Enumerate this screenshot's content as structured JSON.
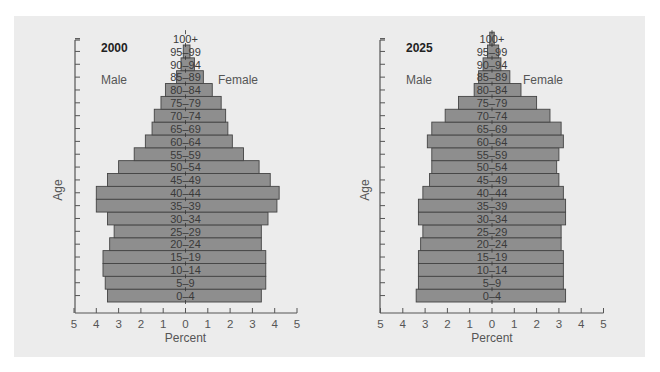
{
  "chart_data": [
    {
      "type": "bar",
      "subtype": "population-pyramid",
      "title": "2000",
      "xlabel": "Percent",
      "ylabel": "Age",
      "left_label": "Male",
      "right_label": "Female",
      "xlim": [
        -5,
        5
      ],
      "x_ticks": [
        "5",
        "4",
        "3",
        "2",
        "1",
        "0",
        "1",
        "2",
        "3",
        "4",
        "5"
      ],
      "grid": false,
      "categories": [
        "0–4",
        "5–9",
        "10–14",
        "15–19",
        "20–24",
        "25–29",
        "30–34",
        "35–39",
        "40–44",
        "45–49",
        "50–54",
        "55–59",
        "60–64",
        "65–69",
        "70–74",
        "75–79",
        "80–84",
        "85–89",
        "90–94",
        "95–99",
        "100+"
      ],
      "series": [
        {
          "name": "Male",
          "values": [
            3.5,
            3.6,
            3.7,
            3.7,
            3.4,
            3.2,
            3.5,
            4.0,
            4.0,
            3.5,
            3.0,
            2.3,
            1.8,
            1.5,
            1.4,
            1.1,
            0.9,
            0.4,
            0.2,
            0.1,
            0.0
          ]
        },
        {
          "name": "Female",
          "values": [
            3.4,
            3.6,
            3.6,
            3.6,
            3.4,
            3.4,
            3.7,
            4.1,
            4.2,
            3.8,
            3.3,
            2.6,
            2.1,
            1.9,
            1.8,
            1.6,
            1.2,
            0.8,
            0.4,
            0.2,
            0.0
          ]
        }
      ]
    },
    {
      "type": "bar",
      "subtype": "population-pyramid",
      "title": "2025",
      "xlabel": "Percent",
      "ylabel": "Age",
      "left_label": "Male",
      "right_label": "Female",
      "xlim": [
        -5,
        5
      ],
      "x_ticks": [
        "5",
        "4",
        "3",
        "2",
        "1",
        "0",
        "1",
        "2",
        "3",
        "4",
        "5"
      ],
      "grid": false,
      "categories": [
        "0–4",
        "5–9",
        "10–14",
        "15–19",
        "20–24",
        "25–29",
        "30–34",
        "35–39",
        "40–44",
        "45–49",
        "50–54",
        "55–59",
        "60–64",
        "65–69",
        "70–74",
        "75–79",
        "80–84",
        "85–89",
        "90–94",
        "95–99",
        "100+"
      ],
      "series": [
        {
          "name": "Male",
          "values": [
            3.4,
            3.3,
            3.3,
            3.3,
            3.2,
            3.1,
            3.3,
            3.3,
            3.1,
            2.8,
            2.7,
            2.7,
            2.9,
            2.7,
            2.1,
            1.5,
            0.8,
            0.6,
            0.4,
            0.2,
            0.1
          ]
        },
        {
          "name": "Female",
          "values": [
            3.3,
            3.2,
            3.2,
            3.2,
            3.1,
            3.1,
            3.3,
            3.3,
            3.2,
            3.0,
            2.9,
            3.0,
            3.2,
            3.1,
            2.6,
            2.0,
            1.3,
            0.8,
            0.4,
            0.3,
            0.1
          ]
        }
      ]
    }
  ],
  "colors": {
    "panel_bg": "#ececec",
    "bar_fill": "#8e8e8e",
    "bar_stroke": "#444444",
    "axis": "#555555",
    "text": "#444444"
  }
}
